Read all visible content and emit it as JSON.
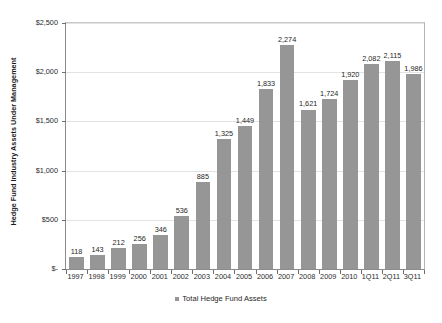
{
  "chart_data": {
    "type": "bar",
    "title": "",
    "xlabel": "",
    "ylabel": "Hedge Fund Industry Assets Under Management",
    "ylim": [
      0,
      2500
    ],
    "ytick_values": [
      0,
      500,
      1000,
      1500,
      2000,
      2500
    ],
    "ytick_labels": [
      "$-",
      "$500",
      "$1,000",
      "$1,500",
      "$2,000",
      "$2,500"
    ],
    "grid": true,
    "legend_position": "bottom-center",
    "legend": [
      "Total Hedge Fund Assets"
    ],
    "categories": [
      "1997",
      "1998",
      "1999",
      "2000",
      "2001",
      "2002",
      "2003",
      "2004",
      "2005",
      "2006",
      "2007",
      "2008",
      "2009",
      "2010",
      "1Q11",
      "2Q11",
      "3Q11"
    ],
    "values": [
      118,
      143,
      212,
      256,
      346,
      536,
      885,
      1325,
      1449,
      1833,
      2274,
      1621,
      1724,
      1920,
      2082,
      2115,
      1986
    ],
    "value_labels": [
      "118",
      "143",
      "212",
      "256",
      "346",
      "536",
      "885",
      "1,325",
      "1,449",
      "1,833",
      "2,274",
      "1,621",
      "1,724",
      "1,920",
      "2,082",
      "2,115",
      "1,986"
    ],
    "series": [
      {
        "name": "Total Hedge Fund Assets",
        "color": "#969696",
        "values": [
          118,
          143,
          212,
          256,
          346,
          536,
          885,
          1325,
          1449,
          1833,
          2274,
          1621,
          1724,
          1920,
          2082,
          2115,
          1986
        ]
      }
    ]
  },
  "colors": {
    "bar": "#969696",
    "gridline": "#e2e2e2",
    "axis": "#8c8c8c",
    "text": "#1f1f1f",
    "background": "#ffffff"
  }
}
